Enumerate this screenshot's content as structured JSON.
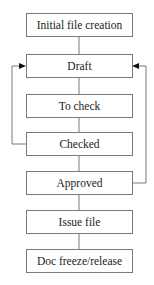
{
  "diagram": {
    "type": "flowchart",
    "steps": [
      {
        "id": "initial",
        "label": "Initial file creation"
      },
      {
        "id": "draft",
        "label": "Draft"
      },
      {
        "id": "to_check",
        "label": "To check"
      },
      {
        "id": "checked",
        "label": "Checked"
      },
      {
        "id": "approved",
        "label": "Approved"
      },
      {
        "id": "issue",
        "label": "Issue file"
      },
      {
        "id": "freeze",
        "label": "Doc freeze/release"
      }
    ],
    "feedback_loops": [
      {
        "from": "Checked",
        "to": "Draft",
        "side": "left"
      },
      {
        "from": "Approved",
        "to": "Draft",
        "side": "right"
      }
    ],
    "colors": {
      "line": "#7a7a7a",
      "arrow": "#111111",
      "text": "#222222"
    }
  }
}
